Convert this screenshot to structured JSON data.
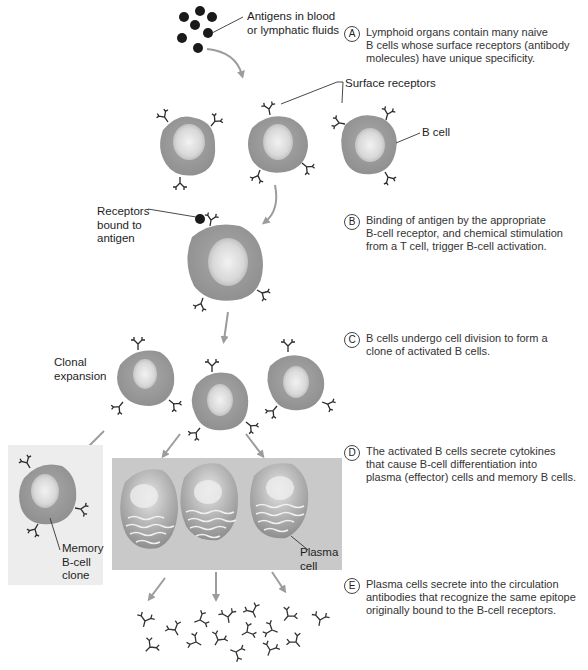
{
  "figure": {
    "colors": {
      "cell_fill": "#9a9a9a",
      "cell_edge": "#8a8a8a",
      "nucleus": "#e8e8e8",
      "antigen": "#1a1a1a",
      "arrow": "#9c9c9c",
      "receptor": "#2a2a2a",
      "panel_bg": "#c9c9c9",
      "memory_bg": "#ededed"
    }
  },
  "labels": {
    "antigens": "Antigens in blood\nor lymphatic fluids",
    "surface_receptors": "Surface receptors",
    "b_cell": "B cell",
    "receptors_bound": "Receptors\nbound to\nantigen",
    "clonal_expansion": "Clonal\nexpansion",
    "memory_clone": "Memory\nB-cell\nclone",
    "plasma_cell": "Plasma\ncell"
  },
  "steps": [
    {
      "badge": "A",
      "text": "Lymphoid organs contain many naive\nB cells whose surface receptors (antibody\nmolecules) have unique specificity."
    },
    {
      "badge": "B",
      "text": "Binding of antigen by the appropriate\nB-cell receptor, and chemical stimulation\nfrom a T cell, trigger B-cell activation."
    },
    {
      "badge": "C",
      "text": "B cells undergo cell division to form a\nclone of activated B cells."
    },
    {
      "badge": "D",
      "text": "The activated B cells secrete cytokines\nthat cause B-cell differentiation into\nplasma (effector) cells and memory B cells."
    },
    {
      "badge": "E",
      "text": "Plasma cells secrete into the circulation\nantibodies that recognize the same epitope\noriginally bound to the B-cell receptors."
    }
  ]
}
